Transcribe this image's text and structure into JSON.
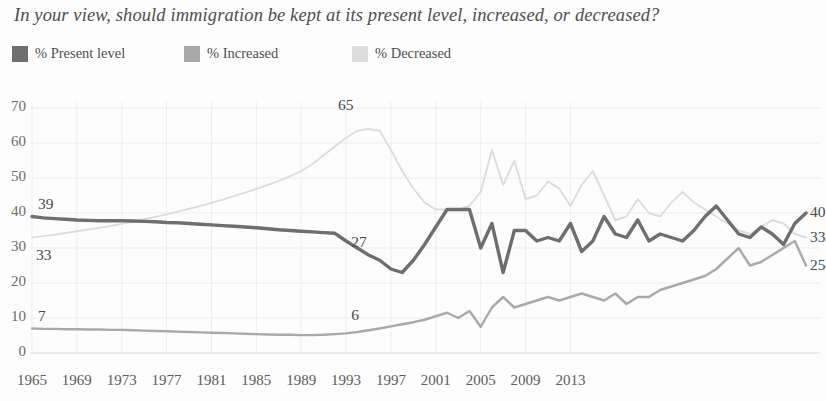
{
  "title": "In your view, should immigration be kept at its present level, increased, or decreased?",
  "legend": {
    "items": [
      {
        "label": "% Present level",
        "color": "#6e6e6e",
        "name": "legend-present-level"
      },
      {
        "label": "% Increased",
        "color": "#a9a9a9",
        "name": "legend-increased"
      },
      {
        "label": "% Decreased",
        "color": "#dcdcdc",
        "name": "legend-decreased"
      }
    ]
  },
  "chart_data": {
    "type": "line",
    "title": "In your view, should immigration be kept at its present level, increased, or decreased?",
    "xlabel": "",
    "ylabel": "",
    "xlim": [
      1965,
      2015
    ],
    "ylim": [
      0,
      70
    ],
    "ytick_step": 10,
    "grid": true,
    "legend_position": "top-left",
    "yticks": [
      "0",
      "10",
      "20",
      "30",
      "40",
      "50",
      "60",
      "70"
    ],
    "xticks": [
      "1965",
      "1969",
      "1973",
      "1977",
      "1981",
      "1985",
      "1989",
      "1993",
      "1997",
      "2001",
      "2005",
      "2009",
      "2013"
    ],
    "annotations": [
      {
        "text": "39",
        "series": "% Present level",
        "x": 1965,
        "y": 39,
        "position": "start-above"
      },
      {
        "text": "33",
        "series": "% Decreased",
        "x": 1965,
        "y": 33,
        "position": "start-below"
      },
      {
        "text": "7",
        "series": "% Increased",
        "x": 1965,
        "y": 7,
        "position": "start-above"
      },
      {
        "text": "65",
        "series": "% Decreased",
        "x": 1993,
        "y": 65,
        "position": "peak-above"
      },
      {
        "text": "27",
        "series": "% Present level",
        "x": 1994,
        "y": 27,
        "position": "above"
      },
      {
        "text": "6",
        "series": "% Increased",
        "x": 1994,
        "y": 6,
        "position": "above"
      },
      {
        "text": "40",
        "series": "% Present level",
        "x": 2015,
        "y": 40,
        "position": "end"
      },
      {
        "text": "33",
        "series": "% Decreased",
        "x": 2015,
        "y": 33,
        "position": "end"
      },
      {
        "text": "25",
        "series": "% Increased",
        "x": 2015,
        "y": 25,
        "position": "end"
      }
    ],
    "series": [
      {
        "name": "% Present level",
        "color": "#6e6e6e",
        "points": [
          [
            1965,
            39.0
          ],
          [
            1966,
            38.6
          ],
          [
            1967,
            38.4
          ],
          [
            1968,
            38.2
          ],
          [
            1969,
            38.0
          ],
          [
            1970,
            37.9
          ],
          [
            1971,
            37.8
          ],
          [
            1972,
            37.8
          ],
          [
            1973,
            37.8
          ],
          [
            1974,
            37.7
          ],
          [
            1975,
            37.6
          ],
          [
            1976,
            37.5
          ],
          [
            1977,
            37.3
          ],
          [
            1978,
            37.2
          ],
          [
            1979,
            37.0
          ],
          [
            1980,
            36.8
          ],
          [
            1981,
            36.6
          ],
          [
            1982,
            36.4
          ],
          [
            1983,
            36.2
          ],
          [
            1984,
            36.0
          ],
          [
            1985,
            35.8
          ],
          [
            1986,
            35.5
          ],
          [
            1987,
            35.2
          ],
          [
            1988,
            35.0
          ],
          [
            1989,
            34.8
          ],
          [
            1990,
            34.6
          ],
          [
            1991,
            34.4
          ],
          [
            1992,
            34.2
          ],
          [
            1993,
            32.0
          ],
          [
            1994,
            30.0
          ],
          [
            1995,
            28.0
          ],
          [
            1996,
            26.5
          ],
          [
            1997,
            24.0
          ],
          [
            1998,
            23.0
          ],
          [
            1999,
            26.5
          ],
          [
            2000,
            31.0
          ],
          [
            2001,
            36.0
          ],
          [
            2002,
            41.0
          ],
          [
            2003,
            41.0
          ],
          [
            2004,
            41.0
          ],
          [
            2005,
            30.0
          ],
          [
            2006,
            37.0
          ],
          [
            2007,
            23.0
          ],
          [
            2008,
            35.0
          ],
          [
            2009,
            35.0
          ],
          [
            2010,
            32.0
          ],
          [
            2011,
            33.0
          ],
          [
            2012,
            32.0
          ],
          [
            2013,
            37.0
          ],
          [
            2014,
            29.0
          ],
          [
            2015,
            32.0
          ],
          [
            2016,
            39.0
          ],
          [
            2017,
            34.0
          ],
          [
            2018,
            33.0
          ],
          [
            2019,
            38.0
          ],
          [
            2020,
            32.0
          ],
          [
            2021,
            34.0
          ],
          [
            2022,
            33.0
          ],
          [
            2023,
            32.0
          ],
          [
            2024,
            35.0
          ],
          [
            2025,
            39.0
          ],
          [
            2026,
            42.0
          ],
          [
            2027,
            38.0
          ],
          [
            2028,
            34.0
          ],
          [
            2029,
            33.0
          ],
          [
            2030,
            36.0
          ],
          [
            2031,
            34.0
          ],
          [
            2032,
            31.0
          ],
          [
            2033,
            37.0
          ],
          [
            2034,
            40.0
          ]
        ]
      },
      {
        "name": "% Decreased",
        "color": "#dcdcdc",
        "points": [
          [
            1965,
            33.0
          ],
          [
            1966,
            33.4
          ],
          [
            1967,
            33.8
          ],
          [
            1968,
            34.3
          ],
          [
            1969,
            34.8
          ],
          [
            1970,
            35.3
          ],
          [
            1971,
            35.8
          ],
          [
            1972,
            36.3
          ],
          [
            1973,
            36.9
          ],
          [
            1974,
            37.5
          ],
          [
            1975,
            38.2
          ],
          [
            1976,
            38.9
          ],
          [
            1977,
            39.6
          ],
          [
            1978,
            40.4
          ],
          [
            1979,
            41.2
          ],
          [
            1980,
            42.0
          ],
          [
            1981,
            42.9
          ],
          [
            1982,
            43.8
          ],
          [
            1983,
            44.8
          ],
          [
            1984,
            45.8
          ],
          [
            1985,
            46.9
          ],
          [
            1986,
            48.0
          ],
          [
            1987,
            49.2
          ],
          [
            1988,
            50.5
          ],
          [
            1989,
            52.0
          ],
          [
            1990,
            54.0
          ],
          [
            1991,
            56.5
          ],
          [
            1992,
            59.0
          ],
          [
            1993,
            61.5
          ],
          [
            1994,
            63.5
          ],
          [
            1995,
            64.0
          ],
          [
            1996,
            63.5
          ],
          [
            1997,
            58.0
          ],
          [
            1998,
            52.0
          ],
          [
            1999,
            47.0
          ],
          [
            2000,
            43.0
          ],
          [
            2001,
            41.0
          ],
          [
            2002,
            41.0
          ],
          [
            2003,
            41.0
          ],
          [
            2004,
            42.0
          ],
          [
            2005,
            46.0
          ],
          [
            2006,
            58.0
          ],
          [
            2007,
            48.0
          ],
          [
            2008,
            55.0
          ],
          [
            2009,
            44.0
          ],
          [
            2010,
            45.0
          ],
          [
            2011,
            49.0
          ],
          [
            2012,
            47.0
          ],
          [
            2013,
            42.0
          ],
          [
            2014,
            48.0
          ],
          [
            2015,
            52.0
          ],
          [
            2016,
            45.0
          ],
          [
            2017,
            38.0
          ],
          [
            2018,
            39.0
          ],
          [
            2019,
            44.0
          ],
          [
            2020,
            40.0
          ],
          [
            2021,
            39.0
          ],
          [
            2022,
            43.0
          ],
          [
            2023,
            46.0
          ],
          [
            2024,
            43.0
          ],
          [
            2025,
            41.0
          ],
          [
            2026,
            39.0
          ],
          [
            2027,
            37.0
          ],
          [
            2028,
            35.0
          ],
          [
            2029,
            34.0
          ],
          [
            2030,
            36.0
          ],
          [
            2031,
            38.0
          ],
          [
            2032,
            37.0
          ],
          [
            2033,
            34.0
          ],
          [
            2034,
            33.0
          ]
        ]
      },
      {
        "name": "% Increased",
        "color": "#a9a9a9",
        "points": [
          [
            1965,
            7.0
          ],
          [
            1966,
            6.9
          ],
          [
            1967,
            6.9
          ],
          [
            1968,
            6.8
          ],
          [
            1969,
            6.8
          ],
          [
            1970,
            6.7
          ],
          [
            1971,
            6.7
          ],
          [
            1972,
            6.6
          ],
          [
            1973,
            6.6
          ],
          [
            1974,
            6.5
          ],
          [
            1975,
            6.4
          ],
          [
            1976,
            6.3
          ],
          [
            1977,
            6.2
          ],
          [
            1978,
            6.1
          ],
          [
            1979,
            6.0
          ],
          [
            1980,
            5.9
          ],
          [
            1981,
            5.8
          ],
          [
            1982,
            5.7
          ],
          [
            1983,
            5.6
          ],
          [
            1984,
            5.5
          ],
          [
            1985,
            5.4
          ],
          [
            1986,
            5.3
          ],
          [
            1987,
            5.2
          ],
          [
            1988,
            5.2
          ],
          [
            1989,
            5.1
          ],
          [
            1990,
            5.1
          ],
          [
            1991,
            5.2
          ],
          [
            1992,
            5.4
          ],
          [
            1993,
            5.6
          ],
          [
            1994,
            6.0
          ],
          [
            1995,
            6.5
          ],
          [
            1996,
            7.0
          ],
          [
            1997,
            7.6
          ],
          [
            1998,
            8.2
          ],
          [
            1999,
            8.8
          ],
          [
            2000,
            9.5
          ],
          [
            2001,
            10.5
          ],
          [
            2002,
            11.5
          ],
          [
            2003,
            10.0
          ],
          [
            2004,
            12.0
          ],
          [
            2005,
            7.5
          ],
          [
            2006,
            13.0
          ],
          [
            2007,
            16.0
          ],
          [
            2008,
            13.0
          ],
          [
            2009,
            14.0
          ],
          [
            2010,
            15.0
          ],
          [
            2011,
            16.0
          ],
          [
            2012,
            15.0
          ],
          [
            2013,
            16.0
          ],
          [
            2014,
            17.0
          ],
          [
            2015,
            16.0
          ],
          [
            2016,
            15.0
          ],
          [
            2017,
            17.0
          ],
          [
            2018,
            14.0
          ],
          [
            2019,
            16.0
          ],
          [
            2020,
            16.0
          ],
          [
            2021,
            18.0
          ],
          [
            2022,
            19.0
          ],
          [
            2023,
            20.0
          ],
          [
            2024,
            21.0
          ],
          [
            2025,
            22.0
          ],
          [
            2026,
            24.0
          ],
          [
            2027,
            27.0
          ],
          [
            2028,
            30.0
          ],
          [
            2029,
            25.0
          ],
          [
            2030,
            26.0
          ],
          [
            2031,
            28.0
          ],
          [
            2032,
            30.0
          ],
          [
            2033,
            32.0
          ],
          [
            2034,
            25.0
          ]
        ]
      }
    ]
  }
}
